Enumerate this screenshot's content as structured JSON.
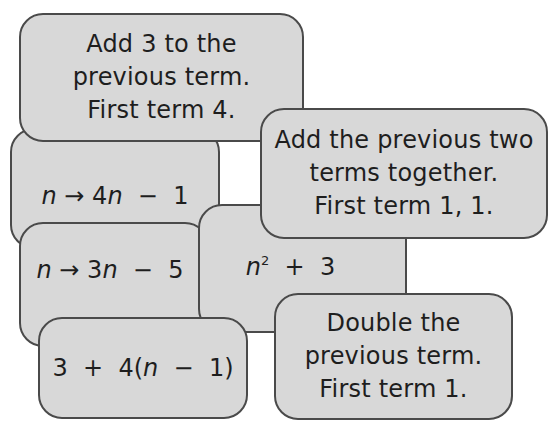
{
  "cards": [
    {
      "id": "add-3",
      "lines": [
        "Add 3 to the",
        "previous term.",
        "First term 4."
      ]
    },
    {
      "id": "4n-minus-1",
      "var": "n",
      "arrow": "→",
      "coef": "4",
      "var2": "n",
      "op": "−",
      "const": "1"
    },
    {
      "id": "add-prev-two",
      "lines": [
        "Add the previous two",
        "terms together.",
        "First term 1, 1."
      ]
    },
    {
      "id": "3n-minus-5",
      "var": "n",
      "arrow": "→",
      "coef": "3",
      "var2": "n",
      "op": "−",
      "const": "5"
    },
    {
      "id": "n-squared-plus-3",
      "var": "n",
      "exp": "2",
      "op": "+",
      "const": "3"
    },
    {
      "id": "3-plus-4-n-minus-1",
      "a": "3",
      "op1": "+",
      "b": "4(",
      "var": "n",
      "op2": "−",
      "c": "1)"
    },
    {
      "id": "double",
      "lines": [
        "Double the",
        "previous term.",
        "First term 1."
      ]
    }
  ],
  "colors": {
    "card_fill": "#d8d8d8",
    "card_border": "#4a4a4a",
    "text": "#1e1e1e",
    "background": "#ffffff"
  }
}
